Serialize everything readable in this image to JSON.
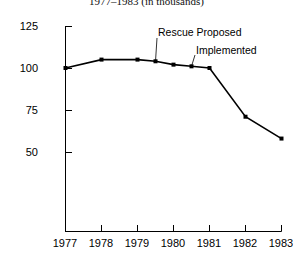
{
  "chart_data": {
    "type": "line",
    "title": "1977–1983 (in thousands)",
    "xlabel": "",
    "ylabel": "",
    "xlim": [
      1977,
      1983
    ],
    "ylim": [
      40,
      125
    ],
    "yticks": [
      125,
      100,
      75,
      50
    ],
    "ytick_labels": [
      "125",
      "100",
      "75",
      "50"
    ],
    "xticks": [
      1977,
      1978,
      1979,
      1980,
      1981,
      1982,
      1983
    ],
    "xtick_labels": [
      "1977",
      "1978",
      "1979",
      "1980",
      "1981",
      "1982",
      "1983"
    ],
    "grid": false,
    "legend": "none",
    "marker": "filled-square",
    "line_color": "#000000",
    "series": [
      {
        "name": "value",
        "x": [
          1977,
          1978,
          1979,
          1979.5,
          1980,
          1980.5,
          1981,
          1982,
          1983
        ],
        "values": [
          100,
          105,
          105,
          104,
          102,
          101,
          100,
          71,
          58
        ]
      }
    ],
    "annotations": [
      {
        "label": "Rescue Proposed",
        "text_x": 1979.6,
        "text_y": 120,
        "point_x": 1979.5,
        "point_y": 104
      },
      {
        "label": "Implemented",
        "text_x": 1980.8,
        "text_y": 113,
        "point_x": 1980.5,
        "point_y": 101
      }
    ]
  }
}
